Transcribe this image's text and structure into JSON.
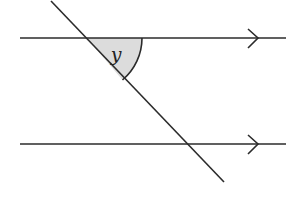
{
  "diagram": {
    "type": "parallel-lines-transversal",
    "angle_label": "y",
    "colors": {
      "line": "#2b2b2b",
      "angle_fill": "#dcdcdc",
      "background": "#ffffff"
    },
    "lines": [
      {
        "name": "top-parallel-line",
        "arrow": "right-chevron"
      },
      {
        "name": "bottom-parallel-line",
        "arrow": "right-chevron"
      },
      {
        "name": "transversal"
      }
    ]
  }
}
